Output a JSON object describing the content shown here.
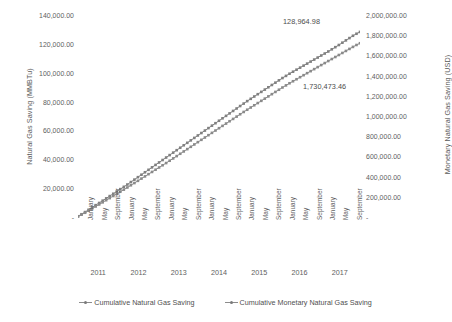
{
  "chart_data": {
    "type": "line",
    "title": "",
    "xlabel": "",
    "ylabel": "Natural Gas Saving (MMBTu)",
    "y2label": "Monetary Natural Gas Saving (USD)",
    "ylim": [
      0,
      140000
    ],
    "y2lim": [
      0,
      2000000
    ],
    "grid": false,
    "legend_position": "bottom",
    "y_ticks": [
      "-",
      "20,000.00",
      "40,000.00",
      "60,000.00",
      "80,000.00",
      "100,000.00",
      "120,000.00",
      "140,000.00"
    ],
    "y2_ticks": [
      "-",
      "200,000.00",
      "400,000.00",
      "600,000.00",
      "800,000.00",
      "1,000,000.00",
      "1,200,000.00",
      "1,400,000.00",
      "1,600,000.00",
      "1,800,000.00",
      "2,000,000.00"
    ],
    "years": [
      "2011",
      "2012",
      "2013",
      "2014",
      "2015",
      "2016",
      "2017"
    ],
    "month_ticks": [
      "January",
      "May",
      "September",
      "January",
      "May",
      "September",
      "January",
      "May",
      "September",
      "January",
      "May",
      "September",
      "January",
      "May",
      "September",
      "January",
      "May",
      "September",
      "January",
      "May",
      "September"
    ],
    "annotations": [
      {
        "name": "gas-end-value",
        "text": "128,964.98"
      },
      {
        "name": "money-end-value",
        "text": "1,730,473.46"
      }
    ],
    "series": [
      {
        "name": "Cumulative Natural Gas Saving",
        "axis": "left",
        "color": "#808080",
        "values": [
          1200,
          2600,
          4100,
          5700,
          7300,
          8900,
          10400,
          12000,
          13600,
          15200,
          16800,
          18400,
          20000,
          21600,
          23200,
          24900,
          26600,
          28300,
          30000,
          31700,
          33400,
          35100,
          36800,
          38500,
          40200,
          41900,
          43600,
          45300,
          47000,
          48700,
          50400,
          52100,
          53800,
          55500,
          57200,
          58900,
          60600,
          62300,
          64000,
          65700,
          67400,
          69100,
          70800,
          72500,
          74200,
          75900,
          77600,
          79300,
          81000,
          82600,
          84200,
          85800,
          87400,
          89000,
          90600,
          92200,
          93800,
          95400,
          97000,
          98500,
          100000,
          101400,
          102800,
          104200,
          105600,
          107000,
          108400,
          109800,
          111200,
          112600,
          114000,
          115400,
          116900,
          118400,
          119900,
          121500,
          123100,
          124700,
          126300,
          127700,
          128964.98
        ]
      },
      {
        "name": "Cumulative Monetary Natural Gas Saving",
        "axis": "right",
        "color": "#8a8a8a",
        "values": [
          15000,
          33000,
          52000,
          72000,
          93000,
          114000,
          134000,
          155000,
          176000,
          197000,
          218000,
          239000,
          260000,
          281000,
          302000,
          324000,
          346000,
          368000,
          390000,
          412000,
          434000,
          456000,
          478000,
          500000,
          522000,
          544000,
          567000,
          590000,
          613000,
          636000,
          659000,
          682000,
          705000,
          728000,
          751000,
          774000,
          797000,
          820000,
          843000,
          866000,
          889000,
          912000,
          935000,
          958000,
          981000,
          1004000,
          1027000,
          1050000,
          1072000,
          1094000,
          1116000,
          1138000,
          1160000,
          1182000,
          1204000,
          1226000,
          1248000,
          1270000,
          1292000,
          1313000,
          1334000,
          1354000,
          1374000,
          1394000,
          1414000,
          1434000,
          1454000,
          1474000,
          1494000,
          1514000,
          1534000,
          1554000,
          1574000,
          1594000,
          1614000,
          1634000,
          1654000,
          1674000,
          1694000,
          1713000,
          1730473.46
        ]
      }
    ]
  }
}
